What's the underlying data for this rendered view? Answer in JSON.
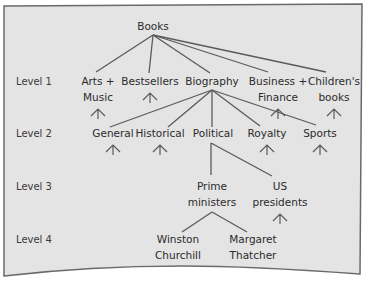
{
  "diagram": {
    "type": "tree",
    "colors": {
      "panel_background": "#e4e4e4",
      "panel_border": "#6a6a6a",
      "line": "#5a5a5a",
      "text": "#2b2b2b"
    },
    "levels": [
      "Level 1",
      "Level 2",
      "Level 3",
      "Level 4"
    ],
    "root": {
      "id": "books",
      "label": [
        "Books"
      ]
    },
    "nodes": [
      {
        "id": "arts",
        "label": [
          "Arts +",
          "Music"
        ],
        "level": 1,
        "parent": "books",
        "collapsed": true
      },
      {
        "id": "bestsellers",
        "label": [
          "Bestsellers"
        ],
        "level": 1,
        "parent": "books",
        "collapsed": true
      },
      {
        "id": "biography",
        "label": [
          "Biography"
        ],
        "level": 1,
        "parent": "books",
        "collapsed": false
      },
      {
        "id": "business",
        "label": [
          "Business +",
          "Finance"
        ],
        "level": 1,
        "parent": "books",
        "collapsed": true
      },
      {
        "id": "childrens",
        "label": [
          "Children's",
          "books"
        ],
        "level": 1,
        "parent": "books",
        "collapsed": true
      },
      {
        "id": "general",
        "label": [
          "General"
        ],
        "level": 2,
        "parent": "biography",
        "collapsed": true
      },
      {
        "id": "historical",
        "label": [
          "Historical"
        ],
        "level": 2,
        "parent": "biography",
        "collapsed": true
      },
      {
        "id": "political",
        "label": [
          "Political"
        ],
        "level": 2,
        "parent": "biography",
        "collapsed": false
      },
      {
        "id": "royalty",
        "label": [
          "Royalty"
        ],
        "level": 2,
        "parent": "biography",
        "collapsed": true
      },
      {
        "id": "sports",
        "label": [
          "Sports"
        ],
        "level": 2,
        "parent": "biography",
        "collapsed": true
      },
      {
        "id": "prime",
        "label": [
          "Prime",
          "ministers"
        ],
        "level": 3,
        "parent": "political",
        "collapsed": false
      },
      {
        "id": "uspres",
        "label": [
          "US",
          "presidents"
        ],
        "level": 3,
        "parent": "political",
        "collapsed": true
      },
      {
        "id": "churchill",
        "label": [
          "Winston",
          "Churchill"
        ],
        "level": 4,
        "parent": "prime",
        "collapsed": false
      },
      {
        "id": "thatcher",
        "label": [
          "Margaret",
          "Thatcher"
        ],
        "level": 4,
        "parent": "prime",
        "collapsed": false
      }
    ]
  }
}
